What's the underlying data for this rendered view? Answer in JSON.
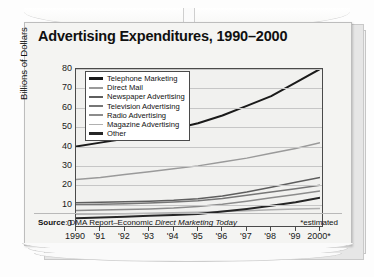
{
  "chart_data": {
    "type": "line",
    "title": "Advertising Expenditures, 1990–2000",
    "xlabel": "Years",
    "ylabel": "Billions of Dollars",
    "ylim": [
      0,
      80
    ],
    "yticks": [
      0,
      10,
      20,
      30,
      40,
      50,
      60,
      70,
      80
    ],
    "grid": true,
    "legend_position": "top-left inside",
    "categories": [
      "1990",
      "'91",
      "'92",
      "'93",
      "'94",
      "'95",
      "'96",
      "'97",
      "'98",
      "'99",
      "2000*"
    ],
    "x": [
      1990,
      1991,
      1992,
      1993,
      1994,
      1995,
      1996,
      1997,
      1998,
      1999,
      2000
    ],
    "series": [
      {
        "name": "Telephone Marketing",
        "color": "#1a1a1a",
        "width": 2.0,
        "values": [
          40,
          42,
          44,
          46,
          49,
          52,
          56,
          61,
          66,
          73,
          80
        ]
      },
      {
        "name": "Direct Mail",
        "color": "#9a9a9a",
        "width": 1.5,
        "values": [
          23,
          24,
          25.5,
          27,
          28.5,
          30,
          32,
          34,
          36.5,
          39,
          42
        ]
      },
      {
        "name": "Newspaper Advertising",
        "color": "#5e5e5e",
        "width": 1.5,
        "values": [
          11,
          11.2,
          11.5,
          11.8,
          12.2,
          13,
          14.5,
          16.5,
          19,
          21.5,
          24
        ]
      },
      {
        "name": "Television Advertising",
        "color": "#767676",
        "width": 1.5,
        "values": [
          10,
          10.2,
          10.5,
          10.8,
          11.3,
          12,
          13.2,
          14.8,
          16.5,
          18.2,
          20
        ]
      },
      {
        "name": "Radio Advertising",
        "color": "#8c8c8c",
        "width": 1.5,
        "values": [
          7,
          7.2,
          7.5,
          7.8,
          8.2,
          9,
          10.2,
          11.8,
          13.5,
          15.2,
          17
        ]
      },
      {
        "name": "Magazine Advertising",
        "color": "#b0b0b0",
        "width": 1.5,
        "values": [
          5,
          5.1,
          5.3,
          5.5,
          5.8,
          6.1,
          6.5,
          6.9,
          7.3,
          7.7,
          8
        ]
      },
      {
        "name": "Other",
        "color": "#262626",
        "width": 2.0,
        "values": [
          3,
          3.4,
          3.8,
          4.2,
          4.6,
          5.2,
          6.4,
          7.8,
          9.4,
          11.2,
          13.5
        ]
      }
    ]
  },
  "footer": {
    "source_label": "Source",
    "source_sep": ": ",
    "source_text": "DMA Report–Economic ",
    "source_italic": "Direct Marketing Today",
    "estimated_note": "*estimated"
  }
}
